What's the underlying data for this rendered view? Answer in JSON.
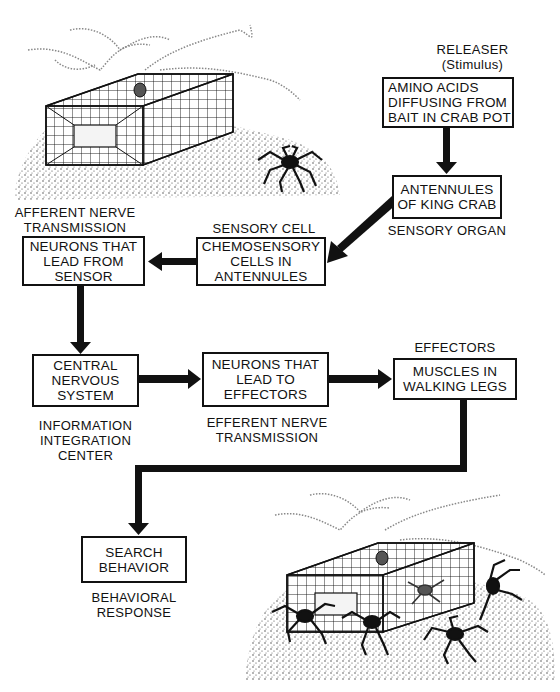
{
  "diagram": {
    "nodes": [
      {
        "id": "stimulus",
        "lines": [
          "AMINO ACIDS",
          "DIFFUSING FROM",
          "BAIT IN CRAB POT"
        ],
        "caption": [
          "RELEASER",
          "(Stimulus)"
        ]
      },
      {
        "id": "sensory_organ",
        "lines": [
          "ANTENNULES",
          "OF KING CRAB"
        ],
        "caption": [
          "SENSORY ORGAN"
        ]
      },
      {
        "id": "sensory_cell",
        "lines": [
          "CHEMOSENSORY",
          "CELLS IN",
          "ANTENNULES"
        ],
        "caption": [
          "SENSORY CELL"
        ]
      },
      {
        "id": "afferent",
        "lines": [
          "NEURONS THAT",
          "LEAD FROM",
          "SENSOR"
        ],
        "caption": [
          "AFFERENT NERVE",
          "TRANSMISSION"
        ]
      },
      {
        "id": "cns",
        "lines": [
          "CENTRAL",
          "NERVOUS",
          "SYSTEM"
        ],
        "caption": [
          "INFORMATION",
          "INTEGRATION",
          "CENTER"
        ]
      },
      {
        "id": "efferent",
        "lines": [
          "NEURONS THAT",
          "LEAD TO",
          "EFFECTORS"
        ],
        "caption": [
          "EFFERENT NERVE",
          "TRANSMISSION"
        ]
      },
      {
        "id": "effectors",
        "lines": [
          "MUSCLES IN",
          "WALKING LEGS"
        ],
        "caption": [
          "EFFECTORS"
        ]
      },
      {
        "id": "response",
        "lines": [
          "SEARCH",
          "BEHAVIOR"
        ],
        "caption": [
          "BEHAVIORAL",
          "RESPONSE"
        ]
      }
    ],
    "edges": [
      {
        "from": "stimulus",
        "to": "sensory_organ"
      },
      {
        "from": "sensory_organ",
        "to": "sensory_cell"
      },
      {
        "from": "sensory_cell",
        "to": "afferent"
      },
      {
        "from": "afferent",
        "to": "cns"
      },
      {
        "from": "cns",
        "to": "efferent"
      },
      {
        "from": "efferent",
        "to": "effectors"
      },
      {
        "from": "effectors",
        "to": "response"
      }
    ],
    "illustrations": [
      {
        "name": "crab-pot-with-one-crab",
        "description": "Mesh crab pot on stippled seafloor with a single king crab nearby"
      },
      {
        "name": "crab-pot-with-many-crabs",
        "description": "Mesh crab pot on stippled seafloor surrounded by several king crabs"
      }
    ]
  },
  "colors": {
    "ink": "#111111",
    "paper": "#ffffff",
    "stipple": "#555555"
  }
}
